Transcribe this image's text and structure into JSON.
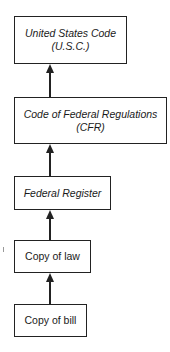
{
  "diagram": {
    "type": "flowchart-vertical",
    "direction": "bottom-to-top",
    "nodes": [
      {
        "id": "usc",
        "label_line1": "United States Code",
        "label_line2": "(U.S.C.)",
        "italic": true
      },
      {
        "id": "cfr",
        "label_line1": "Code of Federal Regulations",
        "label_line2": "(CFR)",
        "italic": true
      },
      {
        "id": "fr",
        "label_line1": "Federal Register",
        "italic": true
      },
      {
        "id": "law",
        "label_line1": "Copy of law",
        "italic": false
      },
      {
        "id": "bill",
        "label_line1": "Copy of bill",
        "italic": false
      }
    ],
    "edges": [
      {
        "from": "bill",
        "to": "law"
      },
      {
        "from": "law",
        "to": "fr"
      },
      {
        "from": "fr",
        "to": "cfr"
      },
      {
        "from": "cfr",
        "to": "usc"
      }
    ]
  }
}
